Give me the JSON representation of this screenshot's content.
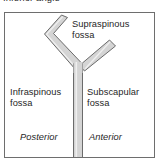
{
  "figure": {
    "caption_above": "Inferior angle",
    "panel": {
      "border_color": "#6e6e6e",
      "background_color": "#ffffff"
    },
    "diagram": {
      "name": "scapula-cross-section",
      "shape": "y-shaped-bone-profile",
      "fill_color": "#d4d4d4",
      "stroke_color": "#6b6b6b",
      "highlight_color": "#efefef"
    },
    "labels": {
      "supraspinous": "Supraspinous\nfossa",
      "supraspinous_line1": "Supraspinous",
      "supraspinous_line2": "fossa",
      "infraspinous_line1": "Infraspinous",
      "infraspinous_line2": "fossa",
      "subscapular_line1": "Subscapular",
      "subscapular_line2": "fossa",
      "posterior": "Posterior",
      "anterior": "Anterior"
    }
  }
}
